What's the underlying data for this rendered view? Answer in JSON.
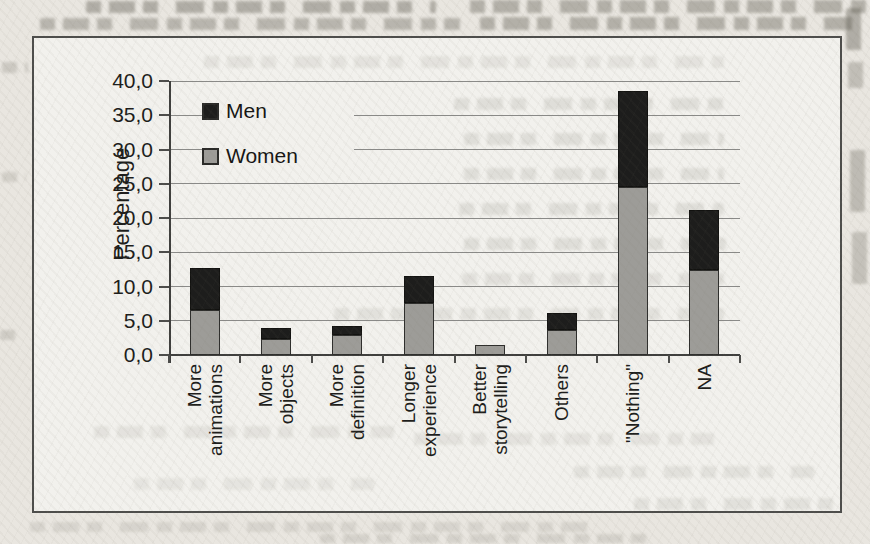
{
  "chart_data": {
    "type": "bar",
    "stacked": true,
    "title": "",
    "ylabel": "Percentage",
    "xlabel": "",
    "ylim": [
      0,
      40
    ],
    "ytick_step": 5,
    "ytick_labels": [
      "0,0",
      "5,0",
      "10,0",
      "15,0",
      "20,0",
      "25,0",
      "30,0",
      "35,0",
      "40,0"
    ],
    "grid": true,
    "legend_position": "top-left-inside",
    "legend_order": [
      "Men",
      "Women"
    ],
    "stack_order_bottom_to_top": [
      "Women",
      "Men"
    ],
    "categories": [
      "More animations",
      "More objects",
      "More definition",
      "Longer experience",
      "Better storytelling",
      "Others",
      "\"Nothing\"",
      "NA"
    ],
    "category_label_lines": [
      [
        "More",
        "animations"
      ],
      [
        "More",
        "objects"
      ],
      [
        "More",
        "definition"
      ],
      [
        "Longer",
        "experience"
      ],
      [
        "Better",
        "storytelling"
      ],
      [
        "Others"
      ],
      [
        "\"Nothing\""
      ],
      [
        "NA"
      ]
    ],
    "series": [
      {
        "name": "Women",
        "color": "#9d9c98",
        "values": [
          6.5,
          2.3,
          2.9,
          7.6,
          1.5,
          3.7,
          24.5,
          12.4
        ]
      },
      {
        "name": "Men",
        "color": "#1d1d1c",
        "values": [
          6.2,
          1.7,
          1.4,
          4.0,
          0.0,
          2.4,
          14.0,
          8.7
        ]
      }
    ],
    "stacked_totals": [
      12.7,
      4.0,
      4.3,
      11.6,
      1.5,
      6.1,
      38.5,
      21.1
    ]
  },
  "colors": {
    "paper": "#e9e6e0",
    "plot_background": "#f2f1ed",
    "frame_border": "#4d4d4b",
    "gridline": "#8a8a88",
    "men_fill": "#1d1d1c",
    "women_fill": "#9d9c98",
    "text": "#1d1d1b"
  }
}
